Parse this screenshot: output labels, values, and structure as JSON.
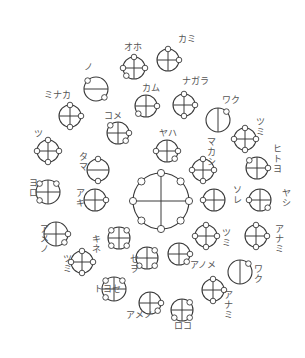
{
  "diagram": {
    "title": "",
    "colors": {
      "stroke": "#3a3a3a",
      "label": "#555555",
      "background": "#ffffff"
    },
    "units": [
      {
        "id": "u1",
        "cx": 134,
        "cy": 68,
        "r": 11,
        "bars": "cross",
        "nodes": [
          [
            0,
            -1
          ],
          [
            1,
            0
          ],
          [
            -1,
            0
          ],
          [
            -0.7,
            0.7
          ]
        ],
        "label": "オホ",
        "lx": 124,
        "ly": 50,
        "vertical": false
      },
      {
        "id": "u2",
        "cx": 168,
        "cy": 60,
        "r": 11,
        "bars": "cross",
        "nodes": [
          [
            0,
            -1
          ],
          [
            1,
            0
          ]
        ],
        "label": "カミ",
        "lx": 178,
        "ly": 42,
        "vertical": false
      },
      {
        "id": "u3",
        "cx": 96,
        "cy": 89,
        "r": 12,
        "bars": "h",
        "nodes": [
          [
            -0.7,
            -0.7
          ],
          [
            0.7,
            0.7
          ]
        ],
        "label": "ノ",
        "lx": 84,
        "ly": 70,
        "vertical": false
      },
      {
        "id": "u4",
        "cx": 146,
        "cy": 106,
        "r": 11,
        "bars": "cross",
        "nodes": [
          [
            1,
            0
          ],
          [
            -0.7,
            0.7
          ]
        ],
        "label": "カム",
        "lx": 142,
        "ly": 91,
        "vertical": false
      },
      {
        "id": "u5",
        "cx": 184,
        "cy": 105,
        "r": 11,
        "bars": "cross",
        "nodes": [
          [
            0,
            -1
          ],
          [
            1,
            0
          ],
          [
            0,
            1
          ]
        ],
        "label": "ナガラ",
        "lx": 182,
        "ly": 84,
        "vertical": false
      },
      {
        "id": "u6",
        "cx": 70,
        "cy": 116,
        "r": 11,
        "bars": "cross",
        "nodes": [
          [
            0,
            -1
          ],
          [
            1,
            0
          ],
          [
            0,
            1
          ]
        ],
        "label": "ミナカ",
        "lx": 44,
        "ly": 98,
        "vertical": false
      },
      {
        "id": "u7",
        "cx": 218,
        "cy": 120,
        "r": 12,
        "bars": "v",
        "nodes": [
          [
            0.7,
            -0.7
          ]
        ],
        "label": "ワク",
        "lx": 222,
        "ly": 103,
        "vertical": false
      },
      {
        "id": "u8",
        "cx": 118,
        "cy": 133,
        "r": 11,
        "bars": "cross",
        "nodes": [
          [
            -0.7,
            -0.7
          ],
          [
            1,
            0
          ],
          [
            0.7,
            0.7
          ]
        ],
        "label": "コメ",
        "lx": 104,
        "ly": 119,
        "vertical": false
      },
      {
        "id": "u9",
        "cx": 48,
        "cy": 151,
        "r": 11,
        "bars": "cross",
        "nodes": [
          [
            0,
            -1
          ],
          [
            1,
            0
          ],
          [
            0,
            1
          ],
          [
            -1,
            0
          ]
        ],
        "label": "ツ",
        "lx": 34,
        "ly": 137,
        "vertical": false
      },
      {
        "id": "u10",
        "cx": 245,
        "cy": 139,
        "r": 11,
        "bars": "cross",
        "nodes": [
          [
            0,
            -1
          ],
          [
            1,
            0
          ],
          [
            0,
            1
          ],
          [
            -1,
            0
          ]
        ],
        "label": "ツミ",
        "lx": 256,
        "ly": 125,
        "vertical": true
      },
      {
        "id": "u11",
        "cx": 167,
        "cy": 151,
        "r": 11,
        "bars": "cross",
        "nodes": [
          [
            -1,
            0
          ],
          [
            1,
            0
          ],
          [
            0.7,
            0.7
          ]
        ],
        "label": "ヤハ",
        "lx": 159,
        "ly": 136,
        "vertical": false
      },
      {
        "id": "u12",
        "cx": 98,
        "cy": 170,
        "r": 11,
        "bars": "h",
        "nodes": [
          [
            0,
            -1
          ],
          [
            0,
            1
          ]
        ],
        "label": "タマ",
        "lx": 79,
        "ly": 160,
        "vertical": true
      },
      {
        "id": "u13",
        "cx": 203,
        "cy": 170,
        "r": 11,
        "bars": "cross",
        "nodes": [
          [
            0,
            -1
          ],
          [
            1,
            0
          ],
          [
            0,
            1
          ],
          [
            -1,
            0
          ]
        ],
        "label": "マカシ",
        "lx": 207,
        "ly": 145,
        "vertical": true
      },
      {
        "id": "u14",
        "cx": 257,
        "cy": 168,
        "r": 11,
        "bars": "cross",
        "nodes": [
          [
            -0.7,
            -0.7
          ],
          [
            1,
            0
          ]
        ],
        "label": "ヒトヨ",
        "lx": 273,
        "ly": 152,
        "vertical": true
      },
      {
        "id": "u15",
        "cx": 48,
        "cy": 192,
        "r": 12,
        "bars": "cross",
        "nodes": [
          [
            -0.7,
            -0.7
          ],
          [
            0.7,
            -0.7
          ],
          [
            -0.7,
            0.7
          ]
        ],
        "label": "ヨロ",
        "lx": 29,
        "ly": 186,
        "vertical": true
      },
      {
        "id": "u16",
        "cx": 161,
        "cy": 201,
        "r": 28,
        "bars": "cross",
        "nodes": [
          [
            0,
            -1
          ],
          [
            0.7,
            -0.7
          ],
          [
            1,
            0
          ],
          [
            0.7,
            0.7
          ],
          [
            0,
            1
          ],
          [
            -0.7,
            0.7
          ],
          [
            -1,
            0
          ],
          [
            -0.7,
            -0.7
          ]
        ],
        "label": "",
        "lx": 0,
        "ly": 0,
        "vertical": false
      },
      {
        "id": "u17",
        "cx": 95,
        "cy": 200,
        "r": 11,
        "bars": "cross",
        "nodes": [
          [
            1,
            0
          ]
        ],
        "label": "アキ",
        "lx": 76,
        "ly": 196,
        "vertical": true
      },
      {
        "id": "u18",
        "cx": 214,
        "cy": 200,
        "r": 11,
        "bars": "cross",
        "nodes": [
          [
            -1,
            0
          ]
        ],
        "label": "ソレ",
        "lx": 233,
        "ly": 193,
        "vertical": true
      },
      {
        "id": "u19",
        "cx": 260,
        "cy": 200,
        "r": 11,
        "bars": "cross",
        "nodes": [
          [
            -1,
            0
          ],
          [
            0.7,
            0.7
          ]
        ],
        "label": "ヤシ",
        "lx": 282,
        "ly": 196,
        "vertical": true
      },
      {
        "id": "u20",
        "cx": 56,
        "cy": 234,
        "r": 12,
        "bars": "cross",
        "nodes": [
          [
            1,
            0
          ],
          [
            0.7,
            0.7
          ]
        ],
        "label": "アメノ",
        "lx": 40,
        "ly": 232,
        "vertical": true
      },
      {
        "id": "u21",
        "cx": 119,
        "cy": 238,
        "r": 11,
        "bars": "cross",
        "nodes": [
          [
            -0.7,
            -0.7
          ],
          [
            0.7,
            -0.7
          ],
          [
            -0.7,
            0.7
          ],
          [
            0.7,
            0.7
          ]
        ],
        "label": "キネ",
        "lx": 92,
        "ly": 242,
        "vertical": true
      },
      {
        "id": "u22",
        "cx": 206,
        "cy": 236,
        "r": 11,
        "bars": "cross",
        "nodes": [
          [
            0,
            -1
          ],
          [
            1,
            0
          ],
          [
            0,
            1
          ],
          [
            -1,
            0
          ]
        ],
        "label": "ツミ",
        "lx": 222,
        "ly": 236,
        "vertical": true
      },
      {
        "id": "u23",
        "cx": 256,
        "cy": 236,
        "r": 11,
        "bars": "cross",
        "nodes": [
          [
            0,
            -1
          ],
          [
            1,
            0
          ],
          [
            0,
            1
          ]
        ],
        "label": "アナミ",
        "lx": 275,
        "ly": 232,
        "vertical": true
      },
      {
        "id": "u24",
        "cx": 147,
        "cy": 258,
        "r": 11,
        "bars": "cross",
        "nodes": [
          [
            0.7,
            -0.7
          ],
          [
            -0.7,
            0.7
          ],
          [
            0.7,
            0.7
          ]
        ],
        "label": "セヲ",
        "lx": 130,
        "ly": 262,
        "vertical": true
      },
      {
        "id": "u25",
        "cx": 179,
        "cy": 254,
        "r": 11,
        "bars": "cross",
        "nodes": [
          [
            1,
            0
          ],
          [
            0.7,
            0.7
          ]
        ],
        "label": "アノメ",
        "lx": 190,
        "ly": 268,
        "vertical": false
      },
      {
        "id": "u26",
        "cx": 82,
        "cy": 262,
        "r": 11,
        "bars": "cross",
        "nodes": [
          [
            0,
            -1
          ],
          [
            1,
            0
          ],
          [
            0,
            1
          ],
          [
            -1,
            0
          ]
        ],
        "label": "ツミ",
        "lx": 63,
        "ly": 262,
        "vertical": true
      },
      {
        "id": "u27",
        "cx": 240,
        "cy": 272,
        "r": 12,
        "bars": "v",
        "nodes": [
          [
            0.7,
            -0.7
          ]
        ],
        "label": "ワク",
        "lx": 254,
        "ly": 272,
        "vertical": true
      },
      {
        "id": "u28",
        "cx": 114,
        "cy": 289,
        "r": 12,
        "bars": "cross",
        "nodes": [
          [
            -0.7,
            -0.7
          ],
          [
            0.7,
            -0.7
          ],
          [
            -0.7,
            0.7
          ]
        ],
        "label": "トヨセ",
        "lx": 94,
        "ly": 292,
        "vertical": false
      },
      {
        "id": "u29",
        "cx": 213,
        "cy": 290,
        "r": 11,
        "bars": "cross",
        "nodes": [
          [
            0,
            -1
          ],
          [
            1,
            0
          ],
          [
            0,
            1
          ]
        ],
        "label": "アナミ",
        "lx": 224,
        "ly": 298,
        "vertical": true
      },
      {
        "id": "u30",
        "cx": 150,
        "cy": 303,
        "r": 11,
        "bars": "cross",
        "nodes": [
          [
            1,
            0
          ],
          [
            0.7,
            0.7
          ]
        ],
        "label": "アメノ",
        "lx": 126,
        "ly": 318,
        "vertical": false
      },
      {
        "id": "u31",
        "cx": 182,
        "cy": 310,
        "r": 11,
        "bars": "cross",
        "nodes": [
          [
            0.7,
            -0.7
          ],
          [
            -0.7,
            0.7
          ],
          [
            0.7,
            0.7
          ]
        ],
        "label": "ロコ",
        "lx": 174,
        "ly": 329,
        "vertical": false
      }
    ]
  }
}
